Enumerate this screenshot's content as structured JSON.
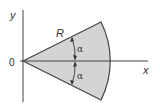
{
  "diagram": {
    "type": "circular-sector",
    "labels": {
      "y_axis": "y",
      "x_axis": "x",
      "origin": "0",
      "radius": "R",
      "angle_upper": "α",
      "angle_lower": "α"
    },
    "colors": {
      "sector_fill": "#d4d4d4",
      "stroke": "#444444",
      "background": "#ffffff"
    }
  }
}
